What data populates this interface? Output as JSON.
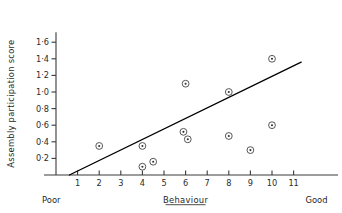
{
  "chart_data": {
    "type": "scatter",
    "title": "",
    "subtitle": "",
    "xlabel": "Behaviour",
    "ylabel": "Assembly participation score",
    "xlim": [
      0,
      12.2
    ],
    "ylim": [
      0,
      1.72
    ],
    "grid": false,
    "legend": null,
    "x_axis": {
      "label": "Behaviour",
      "label_underlined": true,
      "ticks": [
        1,
        2,
        3,
        4,
        5,
        6,
        7,
        8,
        9,
        10,
        11
      ],
      "ticklabels": [
        "1",
        "2",
        "3",
        "4",
        "5",
        "6",
        "7",
        "8",
        "9",
        "10",
        "11"
      ],
      "low_end_label": "Poor",
      "high_end_label": "Good"
    },
    "y_axis": {
      "label": "Assembly participation score",
      "ticks": [
        0.2,
        0.4,
        0.6,
        0.8,
        1.0,
        1.2,
        1.4,
        1.6
      ],
      "ticklabels": [
        "0·2",
        "0·4",
        "0·6",
        "0·8",
        "1·0",
        "1·2",
        "1·4",
        "1·6"
      ]
    },
    "points": [
      {
        "x": 2.0,
        "y": 0.35
      },
      {
        "x": 4.0,
        "y": 0.35
      },
      {
        "x": 4.0,
        "y": 0.1
      },
      {
        "x": 4.5,
        "y": 0.16
      },
      {
        "x": 5.9,
        "y": 0.52
      },
      {
        "x": 6.1,
        "y": 0.43
      },
      {
        "x": 6.0,
        "y": 1.1
      },
      {
        "x": 8.0,
        "y": 1.0
      },
      {
        "x": 8.0,
        "y": 0.47
      },
      {
        "x": 9.0,
        "y": 0.3
      },
      {
        "x": 10.0,
        "y": 0.6
      },
      {
        "x": 10.0,
        "y": 1.4
      }
    ],
    "marker_style": "open-circle-with-center-dot",
    "fit_line": {
      "label": "regression line",
      "x_start": 0.62,
      "y_start": 0.0,
      "x_end": 11.35,
      "y_end": 1.36
    },
    "colors": {
      "axis": "#3a3a3a",
      "marker": "#444444",
      "line": "#000000",
      "text": "#1f1f1f",
      "background": "#ffffff"
    }
  }
}
